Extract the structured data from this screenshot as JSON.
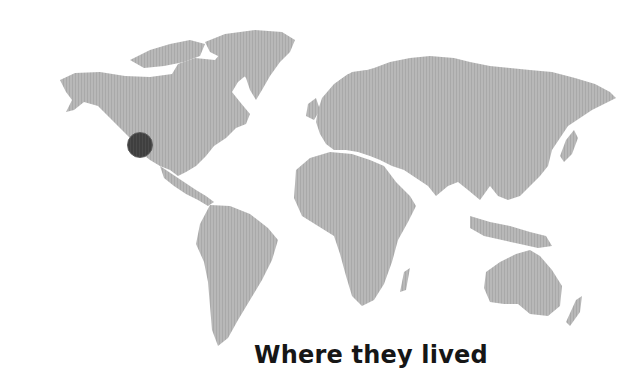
{
  "map": {
    "type": "world-map",
    "land_color": "#b4b4b4",
    "land_stripe_color": "#a8a8a8",
    "background_color": "#ffffff",
    "marker": {
      "label": "",
      "region": "western North America (Pacific Northwest / California)",
      "color": "#444444",
      "cx": 140,
      "cy": 145,
      "radius": 13
    }
  },
  "caption": {
    "text": "Where they lived"
  }
}
